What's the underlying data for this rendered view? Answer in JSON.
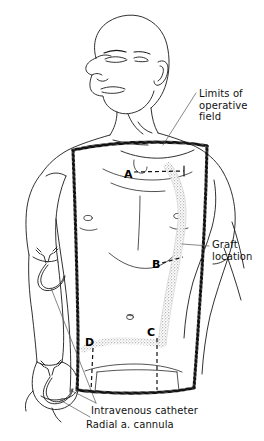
{
  "figure": {
    "kind": "medical-line-illustration",
    "background_color": "#ffffff",
    "ink_color": "#1a1a1a",
    "graft_band_color": "#b8b8b8",
    "drape_edge_color": "#000000"
  },
  "annotations": {
    "limits": {
      "line1": "Limits of",
      "line2": "operative",
      "line3": "field"
    },
    "graft": {
      "line1": "Graft",
      "line2": "location"
    },
    "iv_catheter": "Intravenous catheter",
    "radial_cannula": "Radial a. cannula"
  },
  "markers": {
    "a": "A",
    "b": "B",
    "c": "C",
    "d": "D"
  }
}
